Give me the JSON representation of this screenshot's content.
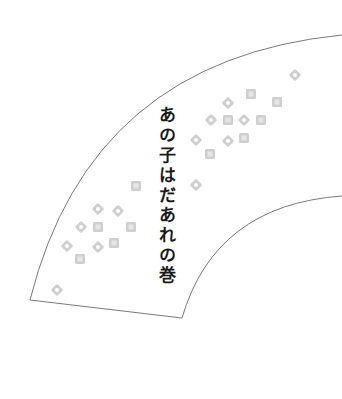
{
  "title": "あの子はだあれの巻",
  "colors": {
    "outline": "#7a7a7a",
    "marker": "#cfcfcf",
    "marker_center": "#ffffff",
    "text": "#1a1a1a",
    "background": "#ffffff"
  },
  "fan": {
    "outer_arc": {
      "start": [
        30,
        300
      ],
      "end": [
        342,
        35
      ]
    },
    "inner_arc": {
      "start": [
        182,
        318
      ],
      "end": [
        342,
        196
      ]
    },
    "bottom_edge": {
      "start": [
        30,
        300
      ],
      "end": [
        182,
        318
      ]
    }
  },
  "markers": [
    {
      "shape": "diamond",
      "x": 295,
      "y": 75
    },
    {
      "shape": "square",
      "x": 251,
      "y": 94
    },
    {
      "shape": "diamond",
      "x": 228,
      "y": 103
    },
    {
      "shape": "square",
      "x": 277,
      "y": 102
    },
    {
      "shape": "diamond",
      "x": 211,
      "y": 120
    },
    {
      "shape": "square",
      "x": 228,
      "y": 120
    },
    {
      "shape": "diamond",
      "x": 244,
      "y": 120
    },
    {
      "shape": "square",
      "x": 261,
      "y": 120
    },
    {
      "shape": "diamond",
      "x": 196,
      "y": 140
    },
    {
      "shape": "diamond",
      "x": 228,
      "y": 141
    },
    {
      "shape": "square",
      "x": 244,
      "y": 138
    },
    {
      "shape": "square",
      "x": 210,
      "y": 154
    },
    {
      "shape": "diamond",
      "x": 196,
      "y": 185
    },
    {
      "shape": "square",
      "x": 136,
      "y": 186
    },
    {
      "shape": "diamond",
      "x": 98,
      "y": 209
    },
    {
      "shape": "diamond",
      "x": 118,
      "y": 211
    },
    {
      "shape": "diamond",
      "x": 81,
      "y": 227
    },
    {
      "shape": "square",
      "x": 98,
      "y": 227
    },
    {
      "shape": "square",
      "x": 131,
      "y": 227
    },
    {
      "shape": "diamond",
      "x": 67,
      "y": 246
    },
    {
      "shape": "diamond",
      "x": 98,
      "y": 247
    },
    {
      "shape": "square",
      "x": 114,
      "y": 243
    },
    {
      "shape": "square",
      "x": 80,
      "y": 259
    },
    {
      "shape": "diamond",
      "x": 57,
      "y": 290
    }
  ]
}
